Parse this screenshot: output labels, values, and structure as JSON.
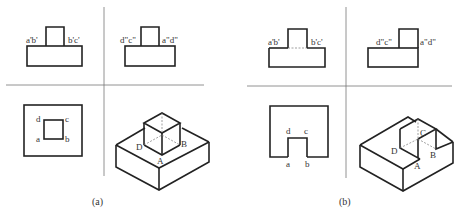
{
  "figure": {
    "panels": [
      {
        "caption": "(a)",
        "front_view": {
          "left_label": "a'b'",
          "right_label": "b'c'"
        },
        "side_view": {
          "left_label": "d\"c\"",
          "right_label": "a\"d\""
        },
        "top_view": {
          "labels": {
            "a": "a",
            "b": "b",
            "c": "c",
            "d": "d"
          }
        },
        "isometric": {
          "labels": {
            "A": "A",
            "B": "B",
            "D": "D"
          }
        }
      },
      {
        "caption": "(b)",
        "front_view": {
          "left_label": "a'b'",
          "right_label": "b'c'"
        },
        "side_view": {
          "left_label": "d\"c\"",
          "right_label": "a\"d\""
        },
        "top_view": {
          "labels": {
            "a": "a",
            "b": "b",
            "c": "c",
            "d": "d"
          }
        },
        "isometric": {
          "labels": {
            "A": "A",
            "B": "B",
            "C": "C",
            "D": "D"
          }
        }
      }
    ]
  }
}
